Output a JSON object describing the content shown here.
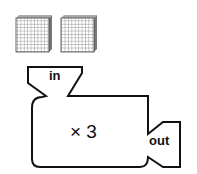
{
  "blocks": {
    "count": 2,
    "description": "hundred blocks (10x10 grids)",
    "grid_size": 10
  },
  "machine": {
    "input_label": "in",
    "operation": "× 3",
    "output_label": "out",
    "stroke_color": "#111111",
    "fill_color": "#ffffff"
  }
}
